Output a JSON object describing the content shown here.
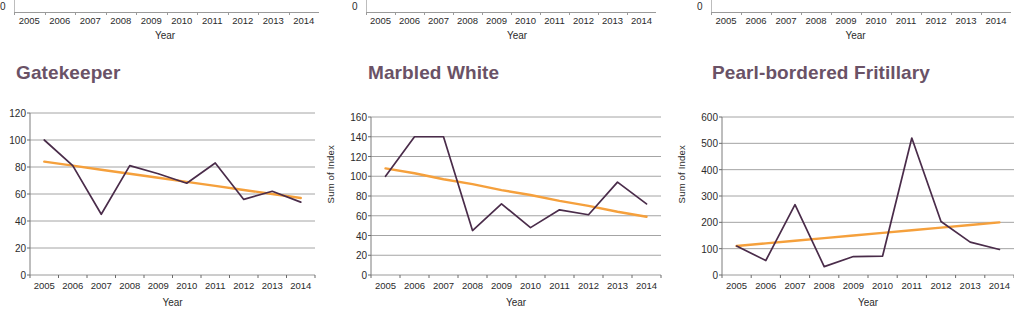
{
  "figure": {
    "background_color": "#ffffff",
    "title_color": "#6a5266",
    "data_line_color": "#4a2c4a",
    "trend_line_color": "#f5a03c",
    "grid_color": "#9a9a9a",
    "axis_title": "Year",
    "y_axis_title": "Sum of Index"
  },
  "top_row": [
    {
      "zero_label": "0",
      "x_title": "Year",
      "categories": [
        "2005",
        "2006",
        "2007",
        "2008",
        "2009",
        "2010",
        "2011",
        "2012",
        "2013",
        "2014"
      ]
    },
    {
      "zero_label": "0",
      "x_title": "Year",
      "categories": [
        "2005",
        "2006",
        "2007",
        "2008",
        "2009",
        "2010",
        "2011",
        "2012",
        "2013",
        "2014"
      ]
    },
    {
      "zero_label": "0",
      "x_title": "Year",
      "categories": [
        "2005",
        "2006",
        "2007",
        "2008",
        "2009",
        "2010",
        "2011",
        "2012",
        "2013",
        "2014"
      ]
    }
  ],
  "chart_data": [
    {
      "type": "line",
      "title": "Gatekeeper",
      "xlabel": "Year",
      "ylabel": "",
      "categories": [
        "2005",
        "2006",
        "2007",
        "2008",
        "2009",
        "2010",
        "2011",
        "2012",
        "2013",
        "2014"
      ],
      "ylim": [
        0,
        120
      ],
      "yticks": [
        0,
        20,
        40,
        60,
        80,
        100,
        120
      ],
      "grid": true,
      "legend": "none",
      "series": [
        {
          "name": "Sum of Index",
          "color": "#4a2c4a",
          "values": [
            100,
            81,
            45,
            81,
            75,
            68,
            83,
            56,
            62,
            54
          ]
        },
        {
          "name": "Linear trend",
          "color": "#f5a03c",
          "values": [
            84,
            81,
            78,
            75,
            72,
            69,
            66,
            63,
            60,
            57
          ]
        }
      ]
    },
    {
      "type": "line",
      "title": "Marbled White",
      "xlabel": "Year",
      "ylabel": "Sum of Index",
      "categories": [
        "2005",
        "2006",
        "2007",
        "2008",
        "2009",
        "2010",
        "2011",
        "2012",
        "2013",
        "2014"
      ],
      "ylim": [
        0,
        160
      ],
      "yticks": [
        0,
        20,
        40,
        60,
        80,
        100,
        120,
        140,
        160
      ],
      "grid": true,
      "legend": "none",
      "series": [
        {
          "name": "Sum of Index",
          "color": "#4a2c4a",
          "values": [
            100,
            140,
            140,
            45,
            72,
            48,
            66,
            61,
            94,
            72
          ]
        },
        {
          "name": "Linear trend",
          "color": "#f5a03c",
          "values": [
            108,
            103,
            97,
            92,
            86,
            81,
            75,
            70,
            64,
            59
          ]
        }
      ]
    },
    {
      "type": "line",
      "title": "Pearl-bordered Fritillary",
      "xlabel": "Year",
      "ylabel": "Sum of Index",
      "categories": [
        "2005",
        "2006",
        "2007",
        "2008",
        "2009",
        "2010",
        "2011",
        "2012",
        "2013",
        "2014"
      ],
      "ylim": [
        0,
        600
      ],
      "yticks": [
        0,
        100,
        200,
        300,
        400,
        500,
        600
      ],
      "grid": true,
      "legend": "none",
      "series": [
        {
          "name": "Sum of Index",
          "color": "#4a2c4a",
          "values": [
            110,
            55,
            267,
            32,
            70,
            72,
            520,
            203,
            125,
            97
          ]
        },
        {
          "name": "Linear trend",
          "color": "#f5a03c",
          "values": [
            110,
            120,
            130,
            140,
            150,
            160,
            170,
            180,
            190,
            200
          ]
        }
      ]
    }
  ]
}
